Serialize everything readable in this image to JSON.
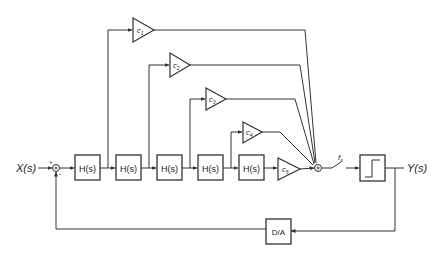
{
  "diagram": {
    "title": "",
    "input_label": "X(s)",
    "output_label": "Y(s)",
    "sum_in_signs": [
      "+",
      "-"
    ],
    "blocks": [
      {
        "id": "H1",
        "label": "H(s)"
      },
      {
        "id": "H2",
        "label": "H(s)"
      },
      {
        "id": "H3",
        "label": "H(s)"
      },
      {
        "id": "H4",
        "label": "H(s)"
      },
      {
        "id": "H5",
        "label": "H(s)"
      }
    ],
    "gains": [
      {
        "id": "c1",
        "base": "c",
        "sub": "1"
      },
      {
        "id": "c2",
        "base": "c",
        "sub": "2"
      },
      {
        "id": "c3",
        "base": "c",
        "sub": "3"
      },
      {
        "id": "c4",
        "base": "c",
        "sub": "4"
      },
      {
        "id": "c5",
        "base": "c",
        "sub": "5"
      }
    ],
    "sampler": {
      "base": "f",
      "sub": "s"
    },
    "quantizer": {
      "name": "1-bit quantizer"
    },
    "dac": {
      "label": "D/A"
    },
    "colors": {
      "stroke": "#333333",
      "background": "#ffffff"
    }
  }
}
